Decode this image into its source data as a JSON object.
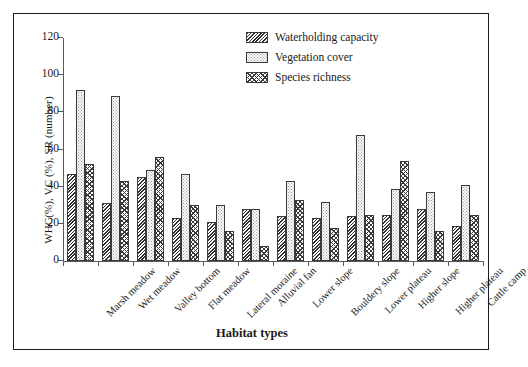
{
  "chart_data": {
    "type": "bar",
    "title": "",
    "xlabel": "Habitat types",
    "ylabel": "WHC(%), VC (%), SR (number)",
    "ylim": [
      0,
      120
    ],
    "yticks": [
      0,
      20,
      40,
      60,
      80,
      100,
      120
    ],
    "grid": false,
    "legend_position": "top-right",
    "categories": [
      "Marsh meadow",
      "Wet meadow",
      "Valley bottom",
      "Flat meadow",
      "Lateral moraine",
      "Alluvial fan",
      "Lower slope",
      "Bouldery slope",
      "Lower plateau",
      "Higher slope",
      "Higher plateau",
      "Cattle camp"
    ],
    "series": [
      {
        "name": "Waterholding capacity",
        "pattern": "diagonal-hatch",
        "values": [
          47,
          31,
          45,
          23,
          21,
          28,
          24,
          23,
          24,
          25,
          28,
          19
        ]
      },
      {
        "name": "Vegetation cover",
        "pattern": "stipple-dots",
        "values": [
          92,
          89,
          49,
          47,
          30,
          28,
          43,
          32,
          68,
          39,
          37,
          41
        ]
      },
      {
        "name": "Species richness",
        "pattern": "cross-hatch",
        "values": [
          52,
          43,
          56,
          30,
          16,
          8,
          33,
          18,
          25,
          54,
          16,
          25
        ]
      }
    ]
  },
  "colors": {
    "frame": "#1b1b1b",
    "axis": "#5a5a5a",
    "ink": "#1a1a1a",
    "hatch": "#2e2e2e"
  }
}
